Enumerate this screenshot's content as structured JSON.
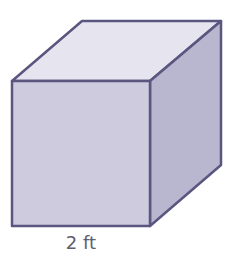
{
  "figure": {
    "type": "cube",
    "dimension_label": "2 ft",
    "vertices": {
      "front_top_left": [
        12,
        81
      ],
      "front_top_right": [
        150,
        81
      ],
      "front_bottom_left": [
        12,
        226
      ],
      "front_bottom_right": [
        150,
        226
      ],
      "back_top_left": [
        82,
        21
      ],
      "back_top_right": [
        221,
        21
      ],
      "back_bottom_right": [
        221,
        165
      ]
    },
    "colors": {
      "front_face": "#cdcbdd",
      "top_face": "#e6e5ef",
      "right_face": "#b9b6cf",
      "edge": "#5a5680",
      "label": "#5f5d6e"
    }
  }
}
